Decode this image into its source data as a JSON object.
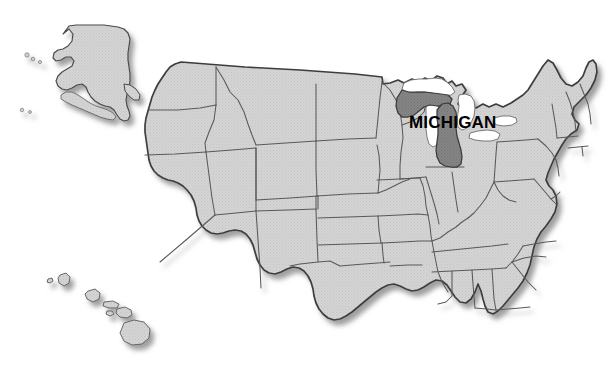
{
  "figure": {
    "kind": "locator-map",
    "highlighted_state": "Michigan",
    "background_color": "#ffffff",
    "includes_insets": [
      "Alaska",
      "Hawaii"
    ]
  },
  "labels": {
    "michigan": "MICHIGAN"
  },
  "colors": {
    "background": "#ffffff",
    "state_fill": "#d2d2d2",
    "state_fill_texture": "#c9c9c9",
    "highlight_fill": "#808080",
    "border_stroke": "#4a4a4a",
    "outer_stroke": "#3a3a3a",
    "lake_fill": "#ffffff",
    "shadow": "#9a9a9a",
    "label_text": "#000000"
  },
  "regions": {
    "contiguous": {
      "name": "Contiguous United States",
      "highlighted": false
    },
    "alaska_inset": {
      "name": "Alaska",
      "highlighted": false
    },
    "hawaii_inset": {
      "name": "Hawaii",
      "highlighted": false
    },
    "michigan": {
      "name": "Michigan",
      "highlighted": true,
      "parts": [
        "Upper Peninsula",
        "Lower Peninsula"
      ]
    }
  },
  "map_data": {
    "type": "choropleth-locator",
    "projection": "albers-usa-style",
    "highlight_value": "Michigan",
    "states_drawn": [
      "Washington",
      "Oregon",
      "California",
      "Nevada",
      "Idaho",
      "Montana",
      "Wyoming",
      "Utah",
      "Arizona",
      "Colorado",
      "New Mexico",
      "North Dakota",
      "South Dakota",
      "Nebraska",
      "Kansas",
      "Oklahoma",
      "Texas",
      "Minnesota",
      "Iowa",
      "Missouri",
      "Arkansas",
      "Louisiana",
      "Wisconsin",
      "Illinois",
      "Michigan",
      "Indiana",
      "Ohio",
      "Kentucky",
      "Tennessee",
      "Mississippi",
      "Alabama",
      "Georgia",
      "Florida",
      "South Carolina",
      "North Carolina",
      "Virginia",
      "West Virginia",
      "Maryland",
      "Delaware",
      "Pennsylvania",
      "New Jersey",
      "New York",
      "Connecticut",
      "Rhode Island",
      "Massachusetts",
      "Vermont",
      "New Hampshire",
      "Maine",
      "Alaska",
      "Hawaii"
    ],
    "great_lakes_shown": [
      "Lake Superior",
      "Lake Michigan",
      "Lake Huron",
      "Lake Erie",
      "Lake Ontario"
    ]
  }
}
